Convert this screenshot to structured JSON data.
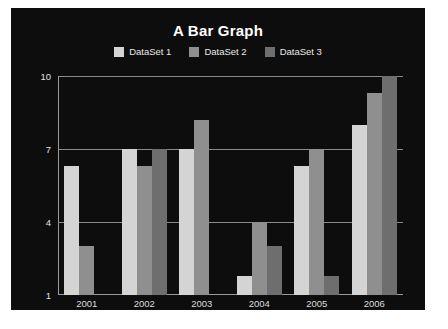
{
  "chart_data": {
    "type": "bar",
    "title": "A Bar Graph",
    "xlabel": "",
    "ylabel": "",
    "categories": [
      "2001",
      "2002",
      "2003",
      "2004",
      "2005",
      "2006"
    ],
    "series": [
      {
        "name": "DataSet 1",
        "color": "#d4d4d4",
        "values": [
          6.3,
          7.0,
          7.0,
          1.8,
          6.3,
          8.0
        ]
      },
      {
        "name": "DataSet 2",
        "color": "#8f8f8f",
        "values": [
          3.0,
          6.3,
          8.2,
          4.0,
          7.0,
          9.3
        ]
      },
      {
        "name": "DataSet 3",
        "color": "#6e6e6e",
        "values": [
          1.0,
          7.0,
          1.0,
          3.0,
          1.8,
          10.0
        ]
      }
    ],
    "ylim": [
      1,
      10
    ],
    "yticks": [
      1,
      4,
      7,
      10
    ],
    "ytick_labels": [
      "1",
      "4",
      "7",
      "10"
    ],
    "grid": true,
    "legend_position": "top-center"
  },
  "style": {
    "panel_background": "#0d0d0d",
    "page_background": "#ffffff",
    "grid_color": "#8a8a8a",
    "axis_color": "#9a9a9a",
    "title_color": "#ffffff",
    "tick_label_color": "#e0e0e0",
    "legend_label_color": "#e8e8e8"
  }
}
